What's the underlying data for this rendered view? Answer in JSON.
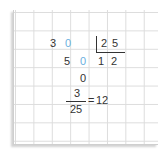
{
  "worksheet": {
    "type": "long-division-grid",
    "grid": {
      "line_color": "#dcdcdc",
      "cell_size_px": 18
    },
    "colors": {
      "ink": "#333333",
      "placeholder_zero": "#6ab0e0"
    },
    "row1": {
      "dividend_digit_1": "3",
      "dividend_digit_2": "0",
      "divisor_digit_1": "2",
      "divisor_digit_2": "5"
    },
    "row2": {
      "remainder_digit_1": "5",
      "remainder_digit_2": "0",
      "quotient_digit_1": "1",
      "quotient_digit_2": "2"
    },
    "row3": {
      "final_remainder": "0"
    },
    "result": {
      "numerator": "3",
      "denominator": "25",
      "equals": "=",
      "value": "12"
    }
  }
}
